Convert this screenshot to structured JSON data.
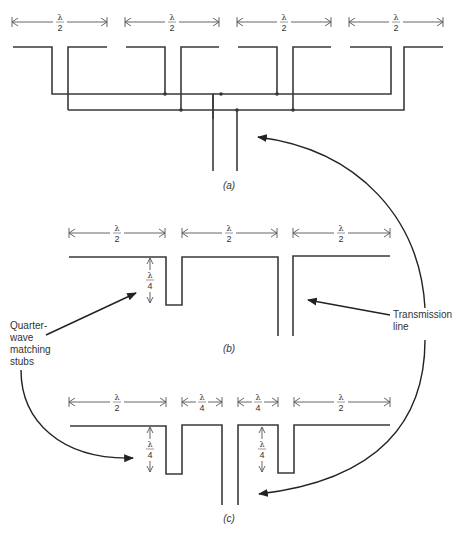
{
  "diagram": {
    "panels": [
      {
        "id": "a",
        "caption": "(a)",
        "dimensions": [
          "λ/2",
          "λ/2",
          "λ/2",
          "λ/2"
        ]
      },
      {
        "id": "b",
        "caption": "(b)",
        "dimensions": [
          "λ/2",
          "λ/2",
          "λ/2"
        ],
        "stub_length": "λ/4"
      },
      {
        "id": "c",
        "caption": "(c)",
        "dimensions": [
          "λ/2",
          "λ/4",
          "λ/4",
          "λ/2"
        ],
        "stub_length": "λ/4"
      }
    ],
    "labels": {
      "lambda": "λ",
      "two": "2",
      "four": "4",
      "quarter_wave_line1": "Quarter-",
      "quarter_wave_line2": "wave",
      "quarter_wave_line3": "matching",
      "quarter_wave_line4": "stubs",
      "transmission_line1": "Transmission",
      "transmission_line2": "line",
      "caption_a": "(a)",
      "caption_b": "(b)",
      "caption_c": "(c)"
    },
    "colors": {
      "line": "#3a3a3a",
      "background": "#ffffff"
    }
  }
}
